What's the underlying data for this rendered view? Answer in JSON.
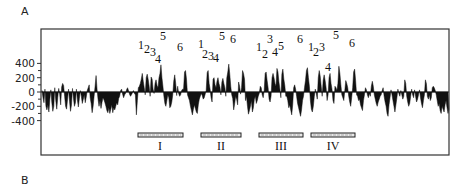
{
  "panels": {
    "a_label": "A",
    "b_label": "B"
  },
  "chart_data": {
    "type": "area",
    "title": "",
    "xlabel": "",
    "ylabel": "",
    "ylim": [
      -400,
      400
    ],
    "yticks": [
      400,
      200,
      0,
      -200,
      -400
    ],
    "ytick_labels": [
      "400",
      "200",
      "0",
      "-200",
      "-400"
    ],
    "minor_yticks": [
      300,
      100,
      -100,
      -300
    ],
    "grid": false,
    "legend": null,
    "x_description": "sequence position (unlabeled)",
    "baseline": 0,
    "x": "pixel-sampled positions 0..407",
    "series": [
      {
        "name": "profile",
        "values": [
          20,
          -80,
          -150,
          40,
          -200,
          -250,
          -180,
          -280,
          -100,
          30,
          -150,
          -270,
          -200,
          60,
          -120,
          -240,
          -80,
          50,
          -30,
          -180,
          70,
          120,
          90,
          -60,
          -200,
          -240,
          -100,
          40,
          -130,
          -270,
          -180,
          50,
          -90,
          -200,
          -150,
          40,
          -110,
          -210,
          -90,
          20,
          -60,
          -160,
          -100,
          -40,
          -150,
          -70,
          20,
          60,
          100,
          -80,
          -160,
          -290,
          -200,
          -60,
          80,
          230,
          40,
          -100,
          -200,
          -120,
          -230,
          -150,
          -80,
          -110,
          -150,
          -200,
          -260,
          -290,
          -220,
          -300,
          -240,
          -180,
          -290,
          -220,
          -250,
          -200,
          -150,
          -180,
          -90,
          -60,
          20,
          40,
          -30,
          -80,
          -40,
          -20,
          30,
          60,
          20,
          -30,
          -60,
          -40,
          -10,
          20,
          -20,
          -40,
          -320,
          -120,
          60,
          80,
          120,
          180,
          260,
          150,
          60,
          -40,
          200,
          250,
          180,
          80,
          -60,
          210,
          180,
          40,
          -20,
          120,
          170,
          90,
          60,
          200,
          260,
          380,
          200,
          80,
          -60,
          -160,
          -200,
          -120,
          -40,
          -80,
          -220,
          -200,
          -140,
          -40,
          150,
          240,
          120,
          -50,
          80,
          -20,
          -60,
          -40,
          20,
          40,
          40,
          280,
          300,
          180,
          -40,
          -80,
          -120,
          -200,
          -260,
          -320,
          -240,
          -180,
          -230,
          -280,
          -300,
          -180,
          -100,
          -60,
          -20,
          -50,
          -100,
          -80,
          -30,
          20,
          270,
          300,
          120,
          40,
          -80,
          -140,
          180,
          200,
          100,
          60,
          150,
          200,
          120,
          70,
          -40,
          140,
          190,
          120,
          60,
          -60,
          200,
          280,
          390,
          250,
          80,
          -40,
          -90,
          -250,
          -160,
          -60,
          -100,
          -180,
          140,
          80,
          -30,
          60,
          300,
          260,
          180,
          -120,
          -60,
          -200,
          -310,
          -260,
          -200,
          -120,
          -280,
          -220,
          -100,
          -60,
          -160,
          -120,
          -60,
          -20,
          80,
          60,
          -40,
          -80,
          20,
          260,
          280,
          160,
          60,
          -100,
          -140,
          -60,
          200,
          260,
          200,
          120,
          80,
          330,
          280,
          140,
          40,
          -80,
          250,
          320,
          180,
          90,
          -60,
          -60,
          -120,
          -220,
          -180,
          -250,
          -320,
          -180,
          60,
          100,
          40,
          -60,
          -160,
          -220,
          -280,
          -340,
          -250,
          -120,
          -60,
          60,
          160,
          300,
          340,
          200,
          80,
          -120,
          -240,
          -280,
          -200,
          -60,
          40,
          -20,
          -100,
          200,
          300,
          220,
          80,
          -60,
          160,
          240,
          160,
          60,
          -120,
          -40,
          200,
          260,
          120,
          40,
          -120,
          -160,
          80,
          60,
          20,
          120,
          360,
          260,
          100,
          -40,
          -80,
          -120,
          20,
          160,
          120,
          60,
          -60,
          -140,
          -200,
          -80,
          60,
          280,
          320,
          160,
          -40,
          -60,
          -120,
          -100,
          -180,
          -220,
          -260,
          -120,
          -40,
          60,
          30,
          -40,
          -80,
          -20,
          -60,
          80,
          150,
          80,
          -40,
          -100,
          -160,
          -200,
          -140,
          -100,
          -60,
          -40,
          20,
          60,
          -60,
          -140,
          -200,
          -300,
          -340,
          -180,
          -80,
          30,
          -40,
          -120,
          -200,
          -280,
          -180,
          -80,
          40,
          -20,
          -60,
          20,
          -40,
          -100,
          -60,
          170,
          120,
          -60,
          -140,
          -200,
          -160,
          -60,
          40,
          -40,
          -80,
          30,
          -60,
          -140,
          -100,
          -40,
          30,
          -80,
          -160,
          -220,
          -120,
          -40,
          170,
          120,
          -60,
          -100,
          -40,
          -120,
          -80,
          60,
          80,
          60,
          20,
          -40,
          -120,
          -200,
          -160,
          -260,
          -300,
          -200,
          -240,
          -280,
          -180,
          -120,
          -220,
          -300,
          -240
        ]
      }
    ],
    "peak_annotations": [
      {
        "group": "I",
        "labels": [
          "1",
          "2",
          "3",
          "4",
          "5",
          "6"
        ]
      },
      {
        "group": "II",
        "labels": [
          "1",
          "2",
          "3",
          "4",
          "5",
          "6"
        ]
      },
      {
        "group": "III",
        "labels": [
          "1",
          "2",
          "3",
          "4",
          "5",
          "6"
        ]
      },
      {
        "group": "IV",
        "labels": [
          "1",
          "2",
          "3",
          "4",
          "5",
          "6"
        ]
      }
    ],
    "region_bars": [
      {
        "label": "I"
      },
      {
        "label": "II"
      },
      {
        "label": "III"
      },
      {
        "label": "IV"
      }
    ]
  },
  "layout": {
    "plot": {
      "left": 41,
      "top": 29,
      "right": 449,
      "bottom": 155,
      "zero_y": 92,
      "px_per_unit": 0.0715
    },
    "peaks": [
      {
        "t": "1",
        "x": 141,
        "y": 49
      },
      {
        "t": "2",
        "x": 147,
        "y": 53
      },
      {
        "t": "3",
        "x": 153,
        "y": 56
      },
      {
        "t": "4",
        "x": 158,
        "y": 63
      },
      {
        "t": "5",
        "x": 163,
        "y": 40
      },
      {
        "t": "6",
        "x": 180,
        "y": 51
      },
      {
        "t": "1",
        "x": 201,
        "y": 48
      },
      {
        "t": "2",
        "x": 205,
        "y": 58
      },
      {
        "t": "3",
        "x": 211,
        "y": 60
      },
      {
        "t": "4",
        "x": 216,
        "y": 62
      },
      {
        "t": "5",
        "x": 222,
        "y": 40
      },
      {
        "t": "6",
        "x": 233,
        "y": 43
      },
      {
        "t": "1",
        "x": 259,
        "y": 51
      },
      {
        "t": "2",
        "x": 265,
        "y": 58
      },
      {
        "t": "3",
        "x": 270,
        "y": 43
      },
      {
        "t": "4",
        "x": 275,
        "y": 56
      },
      {
        "t": "5",
        "x": 281,
        "y": 50
      },
      {
        "t": "6",
        "x": 300,
        "y": 43
      },
      {
        "t": "1",
        "x": 311,
        "y": 51
      },
      {
        "t": "2",
        "x": 316,
        "y": 56
      },
      {
        "t": "3",
        "x": 322,
        "y": 51
      },
      {
        "t": "4",
        "x": 328,
        "y": 71
      },
      {
        "t": "5",
        "x": 336,
        "y": 39
      },
      {
        "t": "6",
        "x": 352,
        "y": 47
      }
    ],
    "bars": [
      {
        "x": 138,
        "w": 45,
        "lx": 160
      },
      {
        "x": 201,
        "w": 40,
        "lx": 221
      },
      {
        "x": 259,
        "w": 44,
        "lx": 281
      },
      {
        "x": 311,
        "w": 44,
        "lx": 333
      }
    ]
  }
}
